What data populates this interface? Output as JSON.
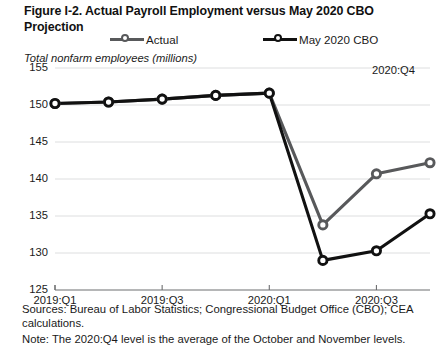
{
  "figure": {
    "title": "Figure I-2. Actual Payroll Employment versus May 2020 CBO Projection",
    "axis_title": "Total nonfarm employees (millions)",
    "annotation": "2020:Q4",
    "sources": "Sources: Bureau of Labor Statistics; Congressional Budget Office (CBO); CEA calculations.",
    "note": "Note: The 2020:Q4 level is the average of the October and November levels."
  },
  "legend": {
    "items": [
      {
        "label": "Actual",
        "color": "#58595b"
      },
      {
        "label": "May 2020 CBO",
        "color": "#111111"
      }
    ]
  },
  "chart_data": {
    "type": "line",
    "title": "Figure I-2. Actual Payroll Employment versus May 2020 CBO Projection",
    "xlabel": "",
    "ylabel": "Total nonfarm employees (millions)",
    "ylim": [
      125,
      155
    ],
    "yticks": [
      125,
      130,
      135,
      140,
      145,
      150,
      155
    ],
    "grid": true,
    "legend_position": "top",
    "x": [
      "2019:Q1",
      "2019:Q2",
      "2019:Q3",
      "2019:Q4",
      "2020:Q1",
      "2020:Q2",
      "2020:Q3",
      "2020:Q4"
    ],
    "xticks": [
      "2019:Q1",
      "2019:Q3",
      "2020:Q1",
      "2020:Q3"
    ],
    "xtick_index": [
      0,
      2,
      4,
      6
    ],
    "series": [
      {
        "name": "Actual",
        "color": "#58595b",
        "values": [
          150.2,
          150.4,
          150.8,
          151.3,
          151.6,
          133.8,
          140.7,
          142.2
        ]
      },
      {
        "name": "May 2020 CBO",
        "color": "#111111",
        "values": [
          150.2,
          150.4,
          150.8,
          151.3,
          151.6,
          129.0,
          130.3,
          135.3
        ]
      }
    ],
    "annotations": [
      {
        "text": "2020:Q4",
        "x": "2020:Q4",
        "position": "top-right"
      }
    ]
  }
}
